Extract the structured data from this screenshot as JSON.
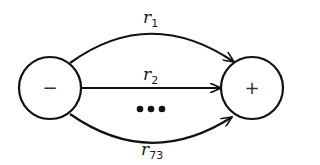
{
  "nodes": {
    "left": {
      "sign": "−",
      "label": "negative-node"
    },
    "right": {
      "sign": "+",
      "label": "positive-node"
    }
  },
  "edges": [
    {
      "var": "r",
      "sub": "1"
    },
    {
      "var": "r",
      "sub": "2"
    },
    {
      "var": "r",
      "sub": "73"
    }
  ],
  "ellipsis": "•••",
  "colors": {
    "stroke": "#111111",
    "background": "#ffffff"
  }
}
